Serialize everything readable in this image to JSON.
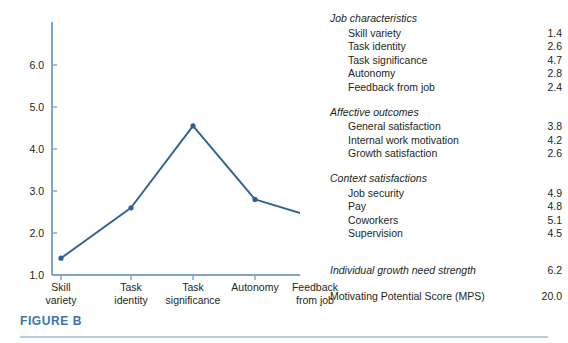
{
  "figure": {
    "caption": "FIGURE B",
    "accent_color": "#3d74ab",
    "line_color": "#2e6094",
    "axis_color": "#7fa5c4"
  },
  "chart_data": {
    "type": "line",
    "title": "",
    "xlabel": "",
    "ylabel": "",
    "categories": [
      "Skill variety",
      "Task identity",
      "Task significance",
      "Autonomy",
      "Feedback from job"
    ],
    "category_lines": [
      [
        "Skill",
        "variety"
      ],
      [
        "Task",
        "identity"
      ],
      [
        "Task",
        "significance"
      ],
      [
        "Autonomy",
        ""
      ],
      [
        "Feedback",
        "from job"
      ]
    ],
    "values": [
      1.4,
      2.6,
      4.7,
      2.8,
      2.4
    ],
    "plotted_values": [
      1.4,
      2.6,
      4.55,
      2.8,
      2.35
    ],
    "ylim": [
      1.0,
      6.6
    ],
    "yticks": [
      1.0,
      2.0,
      3.0,
      4.0,
      5.0,
      6.0
    ],
    "ytick_labels": [
      "1.0",
      "2.0",
      "3.0",
      "4.0",
      "5.0",
      "6.0"
    ],
    "grid": false,
    "legend": false,
    "markers": true
  },
  "panel": {
    "groups": [
      {
        "title": "Job characteristics",
        "rows": [
          {
            "label": "Skill variety",
            "value": "1.4"
          },
          {
            "label": "Task identity",
            "value": "2.6"
          },
          {
            "label": "Task significance",
            "value": "4.7"
          },
          {
            "label": "Autonomy",
            "value": "2.8"
          },
          {
            "label": "Feedback from job",
            "value": "2.4"
          }
        ]
      },
      {
        "title": "Affective outcomes",
        "rows": [
          {
            "label": "General satisfaction",
            "value": "3.8"
          },
          {
            "label": "Internal work motivation",
            "value": "4.2"
          },
          {
            "label": "Growth satisfaction",
            "value": "2.6"
          }
        ]
      },
      {
        "title": "Context satisfactions",
        "rows": [
          {
            "label": "Job security",
            "value": "4.9"
          },
          {
            "label": "Pay",
            "value": "4.8"
          },
          {
            "label": "Coworkers",
            "value": "5.1"
          },
          {
            "label": "Supervision",
            "value": "4.5"
          }
        ]
      }
    ],
    "summary_rows": [
      {
        "label": "Individual growth need strength",
        "value": "6.2",
        "italic": true
      },
      {
        "label": "Motivating Potential Score (MPS)",
        "value": "20.0",
        "italic": false
      }
    ]
  }
}
